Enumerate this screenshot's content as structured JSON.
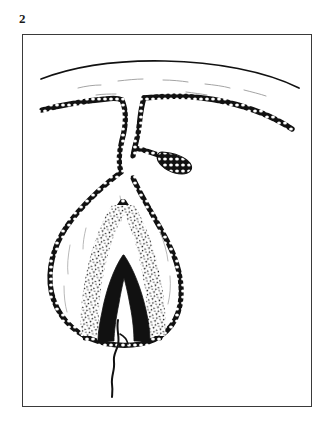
{
  "figure": {
    "number": "2",
    "domain_kind": "anatomical-line-drawing",
    "caption": "",
    "background_color": "#ffffff",
    "ink_color": "#111111",
    "frame_color": "#3a3a3a"
  },
  "plate": {
    "frame": {
      "x": 22,
      "y": 34,
      "width": 290,
      "height": 373,
      "border_width": 1
    }
  },
  "structures": [
    {
      "id": "skin-surface-line",
      "label": "skin-surface-line",
      "description": "Upper free-hand curved outline representing the outer body surface",
      "stroke_style": "solid",
      "stroke_width": 1.6
    },
    {
      "id": "epithelial-cell-layer",
      "label": "epithelial-cell-layer",
      "description": "Beaded cellular band running across the field and lining the invaginated duct and bulb",
      "stroke_style": "beaded",
      "stroke_width": 2.2
    },
    {
      "id": "duct-neck",
      "label": "duct-neck",
      "description": "Narrow invaginated duct descending from the surface epithelium toward the bulb"
    },
    {
      "id": "lateral-bud",
      "label": "lateral-bud",
      "description": "Small club-shaped diverticulum budding laterally to the right from the duct"
    },
    {
      "id": "bulb-outer-wall",
      "label": "bulb-outer-wall",
      "description": "Ovoid outer wall of the terminal bulb, unshaded interior"
    },
    {
      "id": "stippled-matrix-layer",
      "label": "stippled-matrix-layer",
      "description": "Inverted-V stippled layer inside the bulb between the beaded inner sheath and the dark core"
    },
    {
      "id": "dark-core",
      "label": "dark-core",
      "description": "Solid black inverted-V core occupying the centre of the bulb"
    },
    {
      "id": "emerging-filament",
      "label": "emerging-filament",
      "description": "Thin wavy filament emerging downward from the base of the bulb"
    }
  ],
  "palette": {
    "paper": "#ffffff",
    "ink": "#111111",
    "frame": "#3a3a3a",
    "stipple": "#111111"
  }
}
